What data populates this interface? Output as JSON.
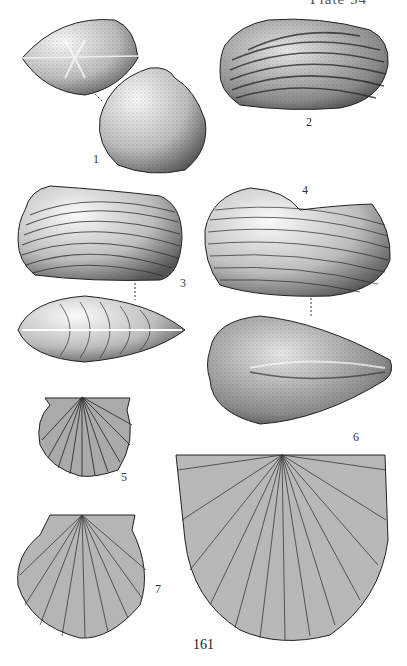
{
  "page": {
    "header": "Plate 54",
    "page_number": "161"
  },
  "figures": [
    {
      "id": "1",
      "label": "1",
      "description": "bivalve shell, dorsal view and lateral view (smooth, stippled)"
    },
    {
      "id": "2",
      "label": "2",
      "description": "elongate bivalve with concentric growth bands"
    },
    {
      "id": "3",
      "label": "3",
      "description": "elongate bivalve, lateral and dorsal view with concentric ribs"
    },
    {
      "id": "4",
      "label": "4",
      "description": "inflated bivalve, lateral view with fine concentric lines"
    },
    {
      "id": "5",
      "label": "5",
      "description": "small scallop with radial ribs"
    },
    {
      "id": "6",
      "label": "6",
      "description": "inflated bivalve, dorsal view"
    },
    {
      "id": "7",
      "label": "7",
      "description": "scallop with fine radial ribs"
    },
    {
      "id": "8",
      "label": "",
      "description": "large radially ribbed shell with straight hinge line"
    }
  ],
  "colors": {
    "ink": "#2a2a2a",
    "paper": "#ffffff"
  }
}
